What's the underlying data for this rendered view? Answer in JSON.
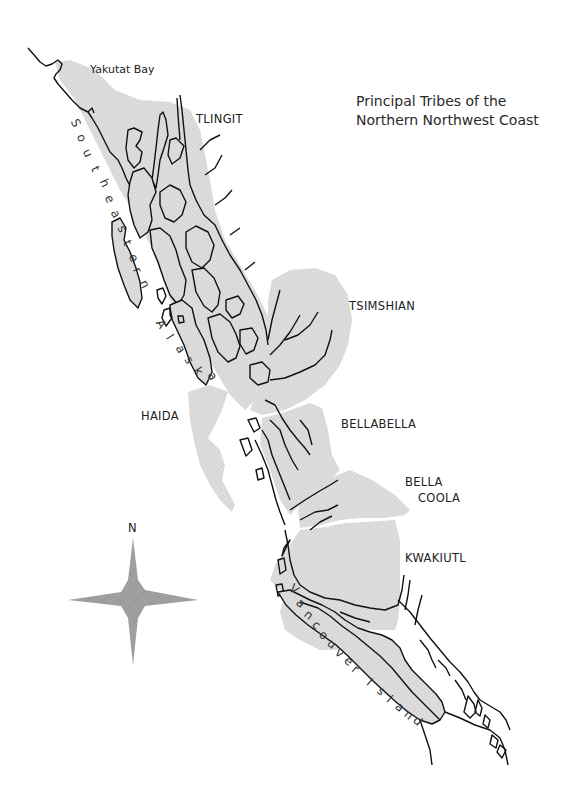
{
  "map": {
    "title_line1": "Principal Tribes of the",
    "title_line2": "Northern Northwest Coast",
    "colors": {
      "territory_fill": "#d9d9d9",
      "coastline": "#111111",
      "background": "#ffffff",
      "compass_fill": "#8a8a8a"
    },
    "tribes": [
      {
        "name": "TLINGIT"
      },
      {
        "name": "TSIMSHIAN"
      },
      {
        "name": "HAIDA"
      },
      {
        "name": "BELLABELLA"
      },
      {
        "name": "BELLA",
        "name2": "COOLA"
      },
      {
        "name": "KWAKIUTL"
      }
    ],
    "places": {
      "yakutat": "Yakutat Bay"
    },
    "regions": {
      "se_alaska_letters": [
        "S",
        "o",
        "u",
        "t",
        "h",
        "e",
        "a",
        "s",
        "t",
        "e",
        "r",
        "n"
      ],
      "alaska_letters": [
        "A",
        "l",
        "a",
        "s",
        "k",
        "a"
      ],
      "vancouver_letters": [
        "V",
        "a",
        "n",
        "c",
        "o",
        "u",
        "v",
        "e",
        "r"
      ],
      "island_letters": [
        "I",
        "s",
        "l",
        "a",
        "n",
        "d"
      ]
    },
    "compass": {
      "north_label": "N"
    }
  }
}
